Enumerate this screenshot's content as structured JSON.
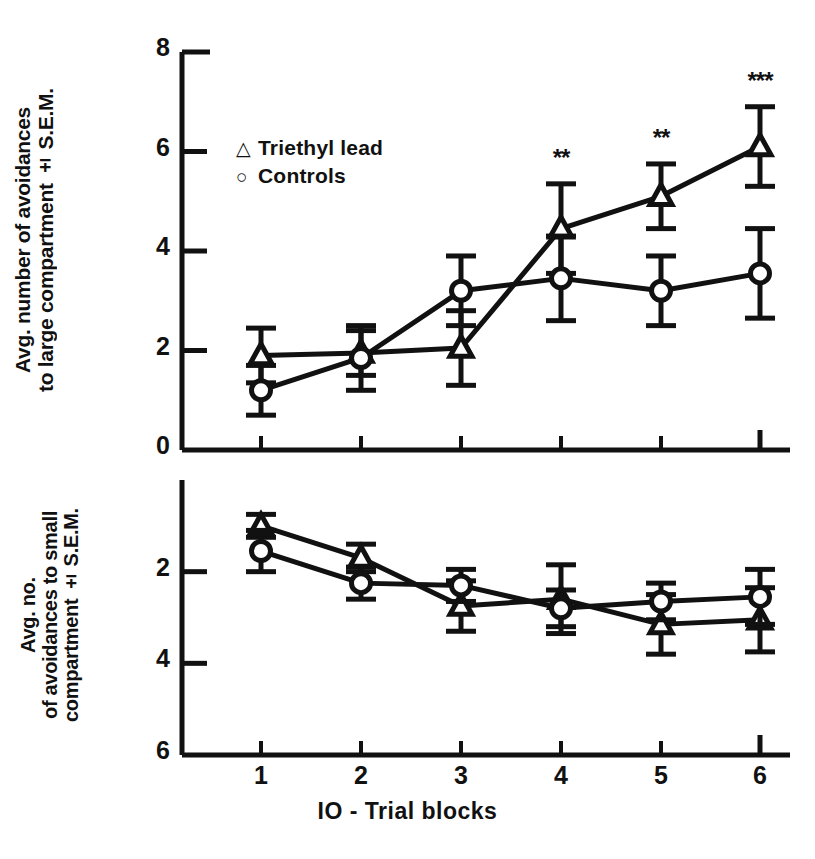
{
  "figure": {
    "xaxis": {
      "title": "IO - Trial blocks",
      "ticks": [
        "1",
        "2",
        "3",
        "4",
        "5",
        "6"
      ],
      "tick_px": [
        261,
        361,
        461,
        561,
        661,
        760
      ],
      "range": [
        1,
        6
      ]
    },
    "panels": [
      {
        "id": "top",
        "ylabel": "Avg. number of avoidances\nto large compartment ± S.E.M.",
        "ylabel_line1": "Avg. number of avoidances",
        "ylabel_line2": "to large compartment ± S.E.M.",
        "yticks": [
          "8",
          "6",
          "4",
          "2",
          "0"
        ],
        "ytick_values": [
          8,
          6,
          4,
          2,
          0
        ],
        "ylim": [
          0,
          8
        ],
        "inverted": false,
        "plot_px": {
          "left": 182,
          "right": 790,
          "top": 52,
          "bottom": 450
        }
      },
      {
        "id": "bottom",
        "ylabel": "Avg. no.\nof avoidances to small\ncompartment ± S.E.M.",
        "ylabel_line1": "Avg. no.",
        "ylabel_line2": "of avoidances to small",
        "ylabel_line3": "compartment ± S.E.M.",
        "yticks": [
          "2",
          "4",
          "6"
        ],
        "ytick_values": [
          2,
          4,
          6
        ],
        "ylim": [
          0,
          6
        ],
        "inverted": true,
        "plot_px": {
          "left": 182,
          "right": 790,
          "top": 480,
          "bottom": 755
        }
      }
    ],
    "legend": {
      "position": "upper-left-inside",
      "entries": [
        {
          "marker": "triangle",
          "glyph": "△",
          "label": "Triethyl lead"
        },
        {
          "marker": "circle",
          "glyph": "○",
          "label": "Controls"
        }
      ]
    },
    "significance": {
      "note": "asterisks above Triethyl lead error bars in top panel",
      "markers": [
        {
          "block": 4,
          "text": "**"
        },
        {
          "block": 5,
          "text": "**"
        },
        {
          "block": 6,
          "text": "***"
        }
      ]
    },
    "colors": {
      "ink": "#111111",
      "background": "#ffffff"
    }
  },
  "chart_data": [
    {
      "type": "line",
      "panel": "top",
      "title": "",
      "xlabel": "IO - Trial blocks",
      "ylabel": "Avg. number of avoidances to large compartment ± S.E.M.",
      "x": [
        1,
        2,
        3,
        4,
        5,
        6
      ],
      "xticklabels": [
        "1",
        "2",
        "3",
        "4",
        "5",
        "6"
      ],
      "ylim": [
        0,
        8
      ],
      "yticks": [
        0,
        2,
        4,
        6,
        8
      ],
      "grid": false,
      "inverted_yaxis": false,
      "legend": [
        "Triethyl lead",
        "Controls"
      ],
      "series": [
        {
          "name": "Triethyl lead",
          "marker": "triangle",
          "values": [
            1.9,
            1.95,
            2.05,
            4.45,
            5.1,
            6.1
          ],
          "errors": [
            0.55,
            0.45,
            0.75,
            0.9,
            0.65,
            0.8
          ]
        },
        {
          "name": "Controls",
          "marker": "circle",
          "values": [
            1.2,
            1.85,
            3.2,
            3.45,
            3.2,
            3.55
          ],
          "errors": [
            0.5,
            0.65,
            0.7,
            0.85,
            0.7,
            0.9
          ]
        }
      ],
      "annotations": [
        {
          "x": 4,
          "y": 4.45,
          "text": "**"
        },
        {
          "x": 5,
          "y": 5.1,
          "text": "**"
        },
        {
          "x": 6,
          "y": 6.1,
          "text": "***"
        }
      ]
    },
    {
      "type": "line",
      "panel": "bottom",
      "title": "",
      "xlabel": "IO - Trial blocks",
      "ylabel": "Avg. no. of avoidances to small compartment ± S.E.M.",
      "x": [
        1,
        2,
        3,
        4,
        5,
        6
      ],
      "xticklabels": [
        "1",
        "2",
        "3",
        "4",
        "5",
        "6"
      ],
      "ylim": [
        0,
        6
      ],
      "yticks": [
        2,
        4,
        6
      ],
      "grid": false,
      "inverted_yaxis": true,
      "legend": [
        "Triethyl lead",
        "Controls"
      ],
      "series": [
        {
          "name": "Triethyl lead",
          "marker": "triangle",
          "values": [
            1.0,
            1.7,
            2.75,
            2.6,
            3.15,
            3.05
          ],
          "errors": [
            0.25,
            0.3,
            0.55,
            0.75,
            0.65,
            0.7
          ]
        },
        {
          "name": "Controls",
          "marker": "circle",
          "values": [
            1.55,
            2.25,
            2.3,
            2.8,
            2.65,
            2.55
          ],
          "errors": [
            0.45,
            0.35,
            0.35,
            0.4,
            0.4,
            0.6
          ]
        }
      ],
      "annotations": []
    }
  ]
}
